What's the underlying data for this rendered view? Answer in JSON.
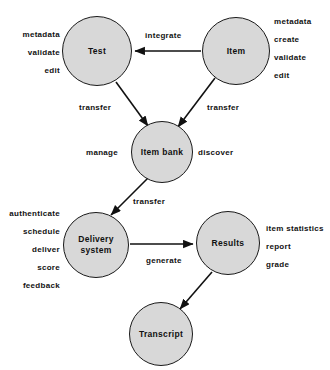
{
  "diagram": {
    "colors": {
      "node_fill": "#d8d8d8",
      "node_stroke": "#1a1a1a",
      "edge_stroke": "#111111",
      "text": "#111111",
      "background": "#ffffff"
    },
    "nodes": [
      {
        "id": "test",
        "label": "Test",
        "cx": 97,
        "cy": 51,
        "r": 35
      },
      {
        "id": "item",
        "label": "Item",
        "cx": 236,
        "cy": 51,
        "r": 34
      },
      {
        "id": "item-bank",
        "label": "Item bank",
        "cx": 162,
        "cy": 152,
        "r": 31
      },
      {
        "id": "delivery-system",
        "label": "Delivery\nsystem",
        "cx": 96,
        "cy": 245,
        "r": 33
      },
      {
        "id": "results",
        "label": "Results",
        "cx": 228,
        "cy": 243,
        "r": 32
      },
      {
        "id": "transcript",
        "label": "Transcript",
        "cx": 161,
        "cy": 334,
        "r": 32
      }
    ],
    "edges": [
      {
        "id": "item-to-test",
        "from": "item",
        "to": "test",
        "label": "integrate",
        "label_x": 145,
        "label_y": 31
      },
      {
        "id": "test-to-item-bank",
        "from": "test",
        "to": "item-bank",
        "label": "transfer",
        "label_x": 79,
        "label_y": 103
      },
      {
        "id": "item-to-item-bank",
        "from": "item",
        "to": "item-bank",
        "label": "transfer",
        "label_x": 207,
        "label_y": 103
      },
      {
        "id": "item-bank-to-delivery",
        "from": "item-bank",
        "to": "delivery-system",
        "label": "transfer",
        "label_x": 133,
        "label_y": 197
      },
      {
        "id": "delivery-to-results",
        "from": "delivery-system",
        "to": "results",
        "label": "generate",
        "label_x": 146,
        "label_y": 256
      },
      {
        "id": "results-to-transcript",
        "from": "results",
        "to": "transcript",
        "label": "",
        "label_x": 0,
        "label_y": 0
      }
    ],
    "node_side_labels": [
      {
        "id": "item-bank-manage",
        "label": "manage",
        "x": 86,
        "y": 148
      },
      {
        "id": "item-bank-discover",
        "label": "discover",
        "x": 198,
        "y": 148
      }
    ],
    "annotations": [
      {
        "id": "test-operations",
        "attached_to": "test",
        "align": "right",
        "x": 4,
        "y": 30,
        "width": 56,
        "items": [
          "metadata",
          "validate",
          "edit"
        ]
      },
      {
        "id": "item-operations",
        "attached_to": "item",
        "align": "left",
        "x": 274,
        "y": 17,
        "width": 54,
        "items": [
          "metadata",
          "create",
          "validate",
          "edit"
        ]
      },
      {
        "id": "delivery-system-operations",
        "attached_to": "delivery-system",
        "align": "right",
        "x": 0,
        "y": 209,
        "width": 60,
        "items": [
          "authenticate",
          "schedule",
          "deliver",
          "score",
          "feedback"
        ]
      },
      {
        "id": "results-operations",
        "attached_to": "results",
        "align": "left",
        "x": 266,
        "y": 224,
        "width": 62,
        "items": [
          "item statistics",
          "report",
          "grade"
        ]
      }
    ]
  }
}
